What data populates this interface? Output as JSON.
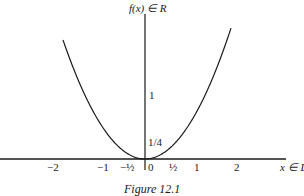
{
  "chart_data": {
    "type": "line",
    "title": "Figure 12.1",
    "xlabel": "x ∈ D",
    "ylabel": "f(x) ∈ R",
    "function": "f(x) = x^2",
    "x_tick_labels": [
      "−2",
      "−1",
      "−½",
      "0",
      "½",
      "1",
      "2"
    ],
    "x_ticks": [
      -2,
      -1,
      -0.5,
      0,
      0.5,
      1,
      2
    ],
    "y_tick_labels": [
      "1/4",
      "1"
    ],
    "y_ticks": [
      0.25,
      1
    ],
    "x": [
      -1.9,
      -1.5,
      -1,
      -0.5,
      0,
      0.5,
      1,
      1.5,
      2
    ],
    "y": [
      3.61,
      2.25,
      1,
      0.25,
      0,
      0.25,
      1,
      2.25,
      4
    ],
    "grid": false,
    "legend": "none"
  },
  "figure": {
    "caption": "Figure 12.1",
    "y_axis_label": "f(x) ∈ R",
    "x_axis_label": "x ∈ D",
    "x_ticks": {
      "m2": "−2",
      "m1": "−1",
      "mhalf": "−½",
      "zero": "0",
      "half": "½",
      "one": "1",
      "two": "2"
    },
    "y_ticks": {
      "one": "1",
      "quarter": "1/4"
    }
  }
}
